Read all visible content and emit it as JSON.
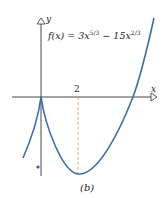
{
  "figure": {
    "equation_prefix": "f(x) = 3x",
    "exp1": "5/3",
    "equation_mid": " − 15x",
    "exp2": "2/3",
    "y_label": "y",
    "x_label": "x",
    "tick_label": "2",
    "caption": "(b)",
    "curve_color": "#3a6ea8",
    "dashed_color": "#e8a070",
    "axis_color": "#333333"
  }
}
